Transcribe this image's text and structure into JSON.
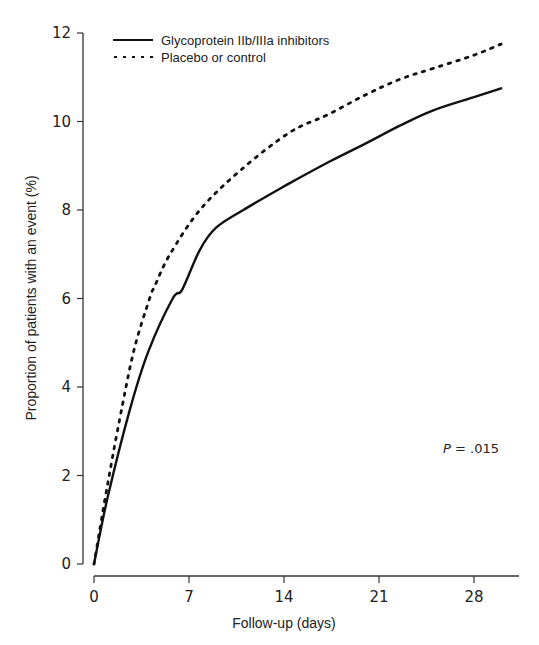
{
  "chart_data": {
    "type": "line",
    "title": "",
    "xlabel": "Follow-up (days)",
    "ylabel": "Proportion of patients with an event (%)",
    "xlim": [
      0,
      30
    ],
    "ylim": [
      0,
      12
    ],
    "x_ticks": [
      0,
      7,
      14,
      21,
      28
    ],
    "y_ticks": [
      0,
      2,
      4,
      6,
      8,
      10,
      12
    ],
    "grid": false,
    "legend_position": "upper left",
    "series": [
      {
        "name": "Glycoprotein IIb/IIIa inhibitors",
        "style": "solid",
        "x": [
          0,
          1,
          2.65,
          4,
          5.8,
          6.5,
          7.8,
          9,
          11,
          14.4,
          17.4,
          20,
          22.5,
          25,
          28,
          30
        ],
        "values": [
          0,
          1.5,
          3.5,
          4.8,
          6.0,
          6.2,
          7.1,
          7.6,
          8.0,
          8.6,
          9.1,
          9.5,
          9.9,
          10.25,
          10.55,
          10.75
        ]
      },
      {
        "name": "Placebo or control",
        "style": "dotted",
        "x": [
          0,
          1,
          2.1,
          3,
          4.1,
          4.5,
          5.6,
          7.8,
          10.8,
          14.4,
          17.2,
          20,
          22.5,
          25,
          28,
          30
        ],
        "values": [
          0,
          1.8,
          3.6,
          4.9,
          6.0,
          6.3,
          7.0,
          8.0,
          8.9,
          9.75,
          10.15,
          10.6,
          10.95,
          11.2,
          11.5,
          11.75
        ]
      }
    ],
    "annotations": [
      {
        "text_prefix": "P",
        "text_suffix": " = .015",
        "x": 27.5,
        "y": 2.7
      }
    ]
  },
  "legend": {
    "items": [
      {
        "label": "Glycoprotein IIb/IIIa inhibitors",
        "style": "solid"
      },
      {
        "label": "Placebo or control",
        "style": "dotted"
      }
    ]
  },
  "axes": {
    "x_title": "Follow-up (days)",
    "y_title": "Proportion of patients with an event (%)",
    "x_tick_labels": [
      "0",
      "7",
      "14",
      "21",
      "28"
    ],
    "y_tick_labels": [
      "0",
      "2",
      "4",
      "6",
      "8",
      "10",
      "12"
    ]
  },
  "annotation": {
    "p_label": "P",
    "p_value": " = .015"
  },
  "colors": {
    "line": "#111111",
    "axis": "#333333",
    "background": "#ffffff"
  }
}
